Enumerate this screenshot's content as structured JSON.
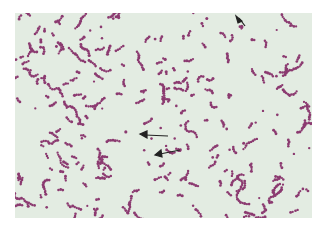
{
  "image": {
    "subject": "Stained bacterial smear micrograph",
    "background_color": "#e3ece2",
    "cell_color": "#8b3a70",
    "arrow_color": "#222222",
    "arrows": [
      {
        "from": [
          232,
          15
        ],
        "to": [
          224,
          34
        ],
        "label": ""
      },
      {
        "from": [
          168,
          136
        ],
        "to": [
          140,
          134
        ],
        "label": ""
      },
      {
        "from": [
          180,
          150
        ],
        "to": [
          156,
          154
        ],
        "label": ""
      }
    ]
  }
}
